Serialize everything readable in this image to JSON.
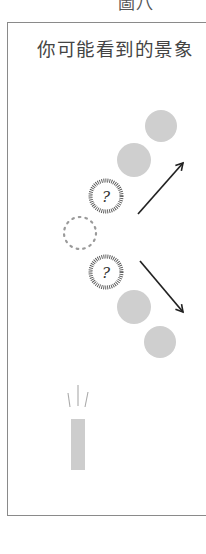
{
  "figure": {
    "caption": "圖八",
    "panel_title": "你可能看到的景象"
  },
  "colors": {
    "frame_border": "#8a8a8a",
    "text": "#444444",
    "gray_ball": "#cfcfcf",
    "arrow": "#222222",
    "dotted": "#999999",
    "hatched_ring": "#555555"
  },
  "elements": {
    "gray_balls": [
      {
        "cx": 161,
        "cy": 126,
        "r": 16
      },
      {
        "cx": 134,
        "cy": 160,
        "r": 17
      },
      {
        "cx": 134,
        "cy": 307,
        "r": 17
      },
      {
        "cx": 160,
        "cy": 342,
        "r": 16
      }
    ],
    "unknown_balls": [
      {
        "cx": 106,
        "cy": 196,
        "r": 17,
        "label": "?"
      },
      {
        "cx": 106,
        "cy": 272,
        "r": 17,
        "label": "?"
      }
    ],
    "dotted_circle": {
      "cx": 80,
      "cy": 233,
      "r": 16
    },
    "arrows": [
      {
        "direction": "up-right",
        "x1": 138,
        "y1": 214,
        "x2": 183,
        "y2": 163
      },
      {
        "direction": "down-right",
        "x1": 140,
        "y1": 261,
        "x2": 183,
        "y2": 312
      }
    ],
    "light_source": {
      "x": 71,
      "y": 419,
      "width": 14,
      "height": 51
    }
  }
}
